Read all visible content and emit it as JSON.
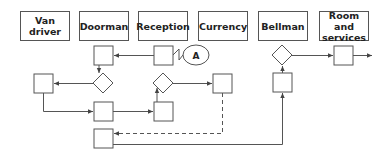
{
  "diagram": {
    "type": "swimlane-service-blueprint",
    "lanes": [
      {
        "label": "Van driver"
      },
      {
        "label": "Doorman"
      },
      {
        "label": "Reception"
      },
      {
        "label": "Currency"
      },
      {
        "label": "Bellman"
      },
      {
        "label": "Room and services"
      }
    ],
    "connector": {
      "label": "A"
    },
    "colors": {
      "stroke": "#555555",
      "text": "#222222",
      "background": "#ffffff"
    }
  }
}
